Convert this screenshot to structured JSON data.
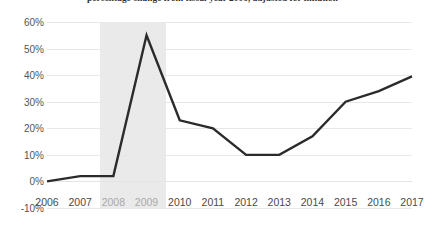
{
  "chart_data": {
    "type": "line",
    "title": "percentage change from fiscal year 2006, adjusted for inflation",
    "xlabel": "",
    "ylabel": "",
    "x": [
      2006,
      2007,
      2008,
      2009,
      2010,
      2011,
      2012,
      2013,
      2014,
      2015,
      2016,
      2017
    ],
    "categories": [
      "2006",
      "2007",
      "2008",
      "2009",
      "2010",
      "2011",
      "2012",
      "2013",
      "2014",
      "2015",
      "2016",
      "2017"
    ],
    "values": [
      0,
      2,
      2,
      55,
      23,
      20,
      10,
      10,
      17,
      30,
      34,
      39.5
    ],
    "series": [
      {
        "name": "percentage change from fiscal year 2006",
        "values": [
          0,
          2,
          2,
          55,
          23,
          20,
          10,
          10,
          17,
          30,
          34,
          39.5
        ],
        "color": "#2b2b2b"
      }
    ],
    "ylim": [
      -10,
      60
    ],
    "yticks": [
      60,
      50,
      40,
      30,
      20,
      10,
      0,
      -10
    ],
    "ytick_labels": [
      "60%",
      "50%",
      "40%",
      "30%",
      "20%",
      "10%",
      "0%",
      "-10%"
    ],
    "xlim": [
      2006,
      2017
    ],
    "grid": true,
    "legend": false,
    "annotations": [
      {
        "type": "shaded-band",
        "name": "recession-band",
        "x_start": 2007.6,
        "x_end": 2009.6,
        "color": "#e6e6e6"
      }
    ]
  },
  "axes": {
    "y_tick_labels": [
      "60%",
      "50%",
      "40%",
      "30%",
      "20%",
      "10%",
      "0%",
      "-10%"
    ],
    "x_tick_labels": [
      "2006",
      "2007",
      "2008",
      "2009",
      "2010",
      "2011",
      "2012",
      "2013",
      "2014",
      "2015",
      "2016",
      "2017"
    ],
    "dimmed_x_ticks": [
      "2008",
      "2009"
    ]
  },
  "style": {
    "line_color": "#2b2b2b",
    "grid_color": "#e8e8e8",
    "band_color": "#e6e6e6",
    "background": "#ffffff",
    "tick_color": "#555555"
  }
}
